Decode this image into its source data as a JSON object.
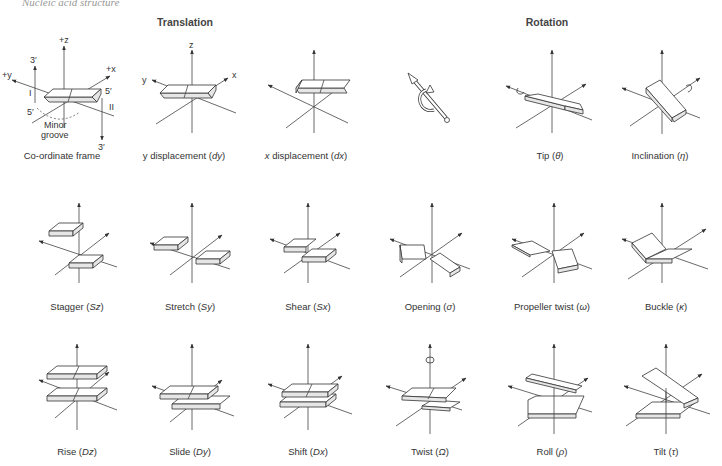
{
  "page": {
    "header": "Nucleic acid structure"
  },
  "sections": {
    "translation": "Translation",
    "rotation": "Rotation"
  },
  "frame_labels": {
    "plus_z": "+z",
    "plus_x": "+x",
    "plus_y": "+y",
    "three_prime_top": "3′",
    "five_prime_left": "5′",
    "five_prime_right": "5′",
    "three_prime_bottom": "3′",
    "strand_one": "I",
    "strand_two": "II",
    "minor_groove_line1": "Minor",
    "minor_groove_line2": "groove",
    "z": "z",
    "x": "x",
    "y": "y"
  },
  "rows": [
    [
      {
        "id": "coordinate-frame",
        "label": "Co-ordinate frame",
        "symbol": ""
      },
      {
        "id": "y-displacement",
        "label": "y displacement",
        "symbol": "dy"
      },
      {
        "id": "x-displacement",
        "label": "x displacement",
        "symbol": "dx"
      },
      {
        "id": "rotation-legend",
        "label": "",
        "symbol": ""
      },
      {
        "id": "tip",
        "label": "Tip",
        "symbol": "θ"
      },
      {
        "id": "inclination",
        "label": "Inclination",
        "symbol": "η"
      }
    ],
    [
      {
        "id": "stagger",
        "label": "Stagger",
        "symbol": "Sz"
      },
      {
        "id": "stretch",
        "label": "Stretch",
        "symbol": "Sy"
      },
      {
        "id": "shear",
        "label": "Shear",
        "symbol": "Sx"
      },
      {
        "id": "opening",
        "label": "Opening",
        "symbol": "σ"
      },
      {
        "id": "propeller-twist",
        "label": "Propeller twist",
        "symbol": "ω"
      },
      {
        "id": "buckle",
        "label": "Buckle",
        "symbol": "κ"
      }
    ],
    [
      {
        "id": "rise",
        "label": "Rise",
        "symbol": "Dz"
      },
      {
        "id": "slide",
        "label": "Slide",
        "symbol": "Dy"
      },
      {
        "id": "shift",
        "label": "Shift",
        "symbol": "Dx"
      },
      {
        "id": "twist",
        "label": "Twist",
        "symbol": "Ω"
      },
      {
        "id": "roll",
        "label": "Roll",
        "symbol": "ρ"
      },
      {
        "id": "tilt",
        "label": "Tilt",
        "symbol": "τ"
      }
    ]
  ],
  "colors": {
    "line": "#444444",
    "slab_face": "#ffffff",
    "slab_side": "#e6e6e6",
    "text": "#333333"
  }
}
